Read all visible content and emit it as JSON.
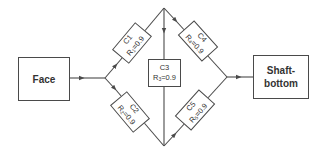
{
  "diagram": {
    "type": "reliability-bridge-network",
    "source": {
      "label": "Face"
    },
    "sink": {
      "label_line1": "Shaft-",
      "label_line2": "bottom"
    },
    "components": [
      {
        "id": "C1",
        "name": "C1",
        "r_symbol": "R",
        "r_sub": "1",
        "r_value": "=0.9"
      },
      {
        "id": "C2",
        "name": "C2",
        "r_symbol": "R",
        "r_sub": "2",
        "r_value": "=0.9"
      },
      {
        "id": "C3",
        "name": "C3",
        "r_symbol": "R",
        "r_sub": "3",
        "r_value": "=0.9"
      },
      {
        "id": "C4",
        "name": "C4",
        "r_symbol": "R",
        "r_sub": "4",
        "r_value": "=0.9"
      },
      {
        "id": "C5",
        "name": "C5",
        "r_symbol": "R",
        "r_sub": "5",
        "r_value": "=0.9"
      }
    ],
    "edges": [
      {
        "from": "Face",
        "to": "left-junction"
      },
      {
        "from": "left-junction",
        "to": "C1"
      },
      {
        "from": "left-junction",
        "to": "C2"
      },
      {
        "from": "C1",
        "to": "top-node"
      },
      {
        "from": "C2",
        "to": "bottom-node"
      },
      {
        "from": "top-node",
        "to": "C3"
      },
      {
        "from": "C3",
        "to": "bottom-node"
      },
      {
        "from": "top-node",
        "to": "C4"
      },
      {
        "from": "bottom-node",
        "to": "C5"
      },
      {
        "from": "C4",
        "to": "right-junction"
      },
      {
        "from": "C5",
        "to": "right-junction"
      },
      {
        "from": "right-junction",
        "to": "Shaft-bottom"
      }
    ],
    "colors": {
      "line": "#4a4a4a",
      "text": "#333333",
      "background": "#ffffff"
    }
  }
}
